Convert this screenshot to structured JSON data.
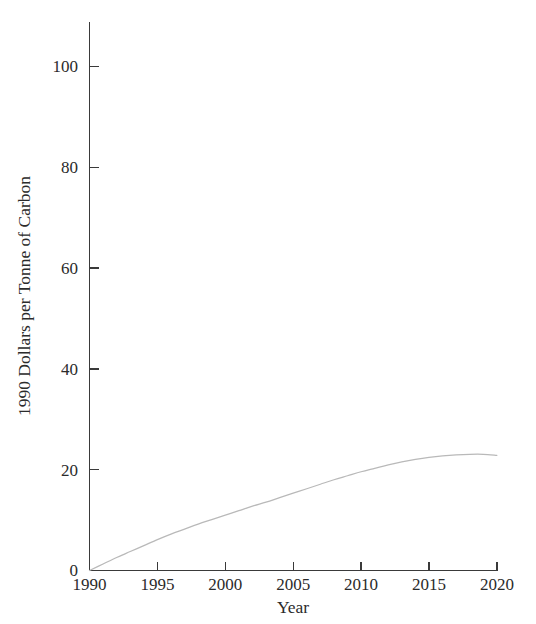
{
  "chart_data": {
    "type": "line",
    "title": "",
    "xlabel": "Year",
    "ylabel": "1990 Dollars per Tonne of Carbon",
    "xlim": [
      1990,
      2020
    ],
    "ylim": [
      0,
      110
    ],
    "grid": false,
    "legend": null,
    "xticks": [
      1990,
      1995,
      2000,
      2005,
      2010,
      2015,
      2020
    ],
    "xtick_labels": [
      "1990",
      "1995",
      "2000",
      "2005",
      "2010",
      "2015",
      "2020"
    ],
    "yticks": [
      0,
      20,
      40,
      60,
      80,
      100
    ],
    "ytick_labels": [
      "0",
      "20",
      "40",
      "60",
      "80",
      "100"
    ],
    "series": [
      {
        "name": "Carbon price",
        "color": "#b9b9b9",
        "x": [
          1990,
          1991,
          1992,
          1993,
          1994,
          1995,
          1996,
          1997,
          1998,
          1999,
          2000,
          2001,
          2002,
          2003,
          2004,
          2005,
          2006,
          2007,
          2008,
          2009,
          2010,
          2011,
          2012,
          2013,
          2014,
          2015,
          2016,
          2017,
          2018,
          2019,
          2020
        ],
        "values": [
          0.0,
          1.3,
          2.6,
          3.8,
          5.0,
          6.2,
          7.3,
          8.3,
          9.3,
          10.2,
          11.1,
          12.0,
          12.9,
          13.7,
          14.6,
          15.5,
          16.4,
          17.3,
          18.2,
          19.0,
          19.8,
          20.5,
          21.2,
          21.8,
          22.3,
          22.7,
          23.0,
          23.2,
          23.3,
          23.3,
          23.1
        ]
      }
    ]
  }
}
